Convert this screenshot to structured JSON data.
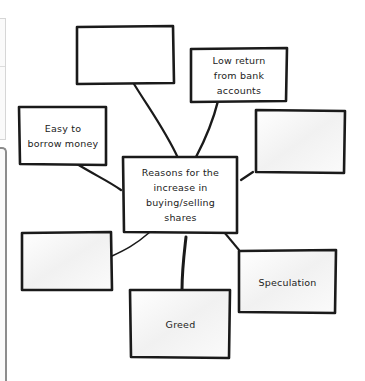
{
  "diagram": {
    "center": {
      "id": "center",
      "label": "Reasons for the\nincrease in\nbuying/selling\nshares"
    },
    "nodes": [
      {
        "id": "top-empty",
        "label": ""
      },
      {
        "id": "low-return",
        "label": "Low return\nfrom bank\naccounts"
      },
      {
        "id": "right-empty",
        "label": ""
      },
      {
        "id": "easy-borrow",
        "label": "Easy to\nborrow money"
      },
      {
        "id": "left-empty",
        "label": ""
      },
      {
        "id": "greed",
        "label": "Greed"
      },
      {
        "id": "speculation",
        "label": "Speculation"
      }
    ],
    "stroke_color": "#1a1a1a",
    "fill_color": "#ffffff"
  }
}
